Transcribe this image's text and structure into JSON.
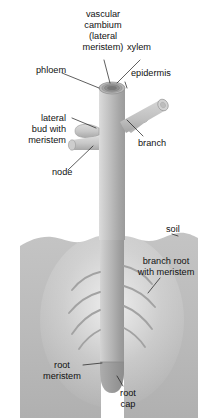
{
  "figure": {
    "background_color": "#ffffff",
    "width": 210,
    "height": 418
  },
  "colors": {
    "stem_light": "#d8d8d8",
    "stem_mid": "#b3b3b3",
    "stem_dark": "#8f8f8f",
    "soil": "#bcbcbc",
    "soil_dark": "#a8a8a8",
    "root_cap": "#9a9a9a",
    "cross_section_outer": "#9e9e9e",
    "cross_section_inner": "#7d7d7d",
    "label_text": "#111111",
    "leader_line": "#1a1a1a"
  },
  "labels": {
    "vascular_cambium": {
      "lines": [
        "vascular",
        "cambium",
        "(lateral",
        "meristem)"
      ],
      "line1": "vascular",
      "line2": "cambium",
      "line3": "(lateral",
      "line4": "meristem)"
    },
    "xylem": {
      "text": "xylem"
    },
    "phloem": {
      "text": "phloem"
    },
    "epidermis": {
      "text": "epidermis"
    },
    "lateral_bud": {
      "lines": [
        "lateral",
        "bud with",
        "meristem"
      ],
      "line1": "lateral",
      "line2": "bud with",
      "line3": "meristem"
    },
    "branch": {
      "text": "branch"
    },
    "node": {
      "text": "node"
    },
    "soil": {
      "text": "soil"
    },
    "branch_root": {
      "lines": [
        "branch root",
        "with meristem"
      ],
      "line1": "branch root",
      "line2": "with meristem"
    },
    "root_meristem": {
      "lines": [
        "root",
        "meristem"
      ],
      "line1": "root",
      "line2": "meristem"
    },
    "root_cap": {
      "lines": [
        "root",
        "cap"
      ],
      "line1": "root",
      "line2": "cap"
    }
  },
  "structures": {
    "stem": {
      "name": "main stem",
      "orientation": "vertical"
    },
    "stem_cross_section": {
      "name": "stem cut top showing epidermis, phloem, vascular cambium, xylem"
    },
    "branches": {
      "count": 2,
      "direction": "upper right"
    },
    "lateral_bud": {
      "count": 1,
      "direction": "left"
    },
    "branch_roots": {
      "count_left": 4,
      "count_right": 4
    },
    "root_tip": {
      "name": "root apex with root cap"
    },
    "soil_line": {
      "name": "irregular soil surface"
    }
  }
}
